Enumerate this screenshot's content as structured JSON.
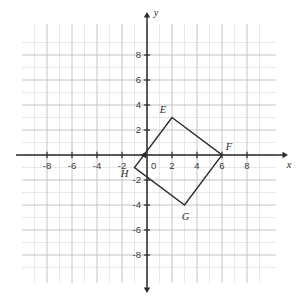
{
  "chart_data": {
    "type": "scatter",
    "title": "",
    "xlabel": "x",
    "ylabel": "y",
    "xlim": [
      -9.5,
      9.5
    ],
    "ylim": [
      -9.5,
      9.5
    ],
    "grid": true,
    "grid_step": 1,
    "legend": "none",
    "origin_label": "0",
    "x_ticks": [
      -8,
      -6,
      -4,
      -2,
      2,
      4,
      6,
      8
    ],
    "y_ticks": [
      8,
      6,
      4,
      2,
      -2,
      -4,
      -6,
      -8
    ],
    "x_tick_labels": [
      "-8",
      "-6",
      "-4",
      "-2",
      "2",
      "4",
      "6",
      "8"
    ],
    "y_tick_labels": [
      "8",
      "6",
      "4",
      "2",
      "-2",
      "-4",
      "-6",
      "-8"
    ],
    "shapes": [
      {
        "name": "quadrilateral-EFGH",
        "kind": "polygon",
        "closed": true,
        "stroke": "#2b2b2b",
        "fill": "none",
        "vertices": [
          {
            "label": "E",
            "x": 2,
            "y": 3
          },
          {
            "label": "F",
            "x": 6,
            "y": 0
          },
          {
            "label": "G",
            "x": 3,
            "y": -4
          },
          {
            "label": "H",
            "x": -1,
            "y": -1
          }
        ]
      }
    ]
  },
  "style": {
    "grid_minor_color": "#d8d8dc",
    "grid_major_color": "#bdbdc4",
    "axis_color": "#2b2b2b",
    "shape_color": "#2b2b2b",
    "background": "#ffffff"
  },
  "geometry": {
    "origin_px": {
      "x": 147,
      "y": 155
    },
    "unit_px": 12.5,
    "grid_bounds_px": {
      "left": 22,
      "top": 24,
      "right": 276,
      "bottom": 283
    }
  }
}
